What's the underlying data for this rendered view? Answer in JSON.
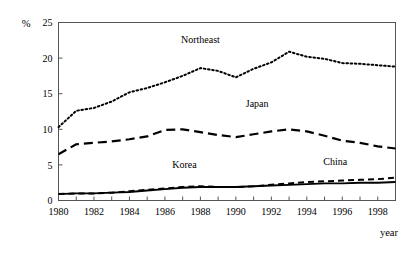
{
  "chart_data": {
    "type": "line",
    "title": "",
    "xlabel": "year",
    "ylabel": "%",
    "xlim": [
      1980,
      1999
    ],
    "ylim": [
      0,
      25
    ],
    "grid": false,
    "legend_position": "inline-annotations",
    "x": [
      1980,
      1981,
      1982,
      1983,
      1984,
      1985,
      1986,
      1987,
      1988,
      1989,
      1990,
      1991,
      1992,
      1993,
      1994,
      1995,
      1996,
      1997,
      1998,
      1999
    ],
    "xtick_labels": [
      "1980",
      "1982",
      "1984",
      "1986",
      "1988",
      "1990",
      "1992",
      "1994",
      "1996",
      "1998"
    ],
    "xtick_values": [
      1980,
      1982,
      1984,
      1986,
      1988,
      1990,
      1992,
      1994,
      1996,
      1998
    ],
    "ytick_labels": [
      "0",
      "5",
      "10",
      "15",
      "20",
      "25"
    ],
    "ytick_values": [
      0,
      5,
      10,
      15,
      20,
      25
    ],
    "series": [
      {
        "name": "Northeast",
        "style": "dotted",
        "label_x": 1988.0,
        "label_y": 22.1,
        "values": [
          10.3,
          12.6,
          13.0,
          13.9,
          15.2,
          15.8,
          16.6,
          17.5,
          18.6,
          18.2,
          17.3,
          18.5,
          19.4,
          20.9,
          20.2,
          19.9,
          19.3,
          19.2,
          19.0,
          18.8
        ]
      },
      {
        "name": "Japan",
        "style": "long-dash",
        "label_x": 1991.2,
        "label_y": 13.2,
        "values": [
          6.5,
          7.9,
          8.1,
          8.3,
          8.6,
          9.0,
          9.9,
          10.0,
          9.6,
          9.2,
          8.9,
          9.3,
          9.7,
          10.0,
          9.7,
          9.1,
          8.4,
          8.1,
          7.6,
          7.3
        ]
      },
      {
        "name": "China",
        "style": "dash",
        "label_x": 1995.6,
        "label_y": 5.0,
        "values": [
          0.9,
          1.0,
          1.0,
          1.1,
          1.3,
          1.5,
          1.7,
          1.9,
          2.0,
          1.9,
          1.9,
          2.0,
          2.2,
          2.4,
          2.6,
          2.7,
          2.8,
          2.9,
          3.0,
          3.2
        ]
      },
      {
        "name": "Korea",
        "style": "solid",
        "label_x": 1987.1,
        "label_y": 4.6,
        "values": [
          0.9,
          1.0,
          1.0,
          1.1,
          1.2,
          1.4,
          1.6,
          1.8,
          1.9,
          1.9,
          1.9,
          2.0,
          2.1,
          2.2,
          2.3,
          2.4,
          2.4,
          2.5,
          2.5,
          2.6
        ]
      }
    ]
  }
}
